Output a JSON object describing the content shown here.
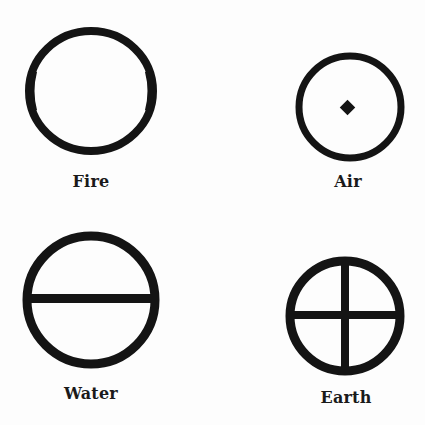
{
  "diagram": {
    "kind": "alchemical-element-symbols",
    "ink_color": "#141414",
    "background_color": "#fdfdfd",
    "elements": [
      {
        "name": "Fire",
        "label": "Fire",
        "symbol": "plain circle",
        "center": [
          91,
          91
        ],
        "radius": [
          64,
          62
        ]
      },
      {
        "name": "Air",
        "label": "Air",
        "symbol": "circle with central diamond dot",
        "center": [
          350,
          107
        ],
        "radius": [
          53,
          53
        ]
      },
      {
        "name": "Water",
        "label": "Water",
        "symbol": "circle with horizontal bar",
        "center": [
          91,
          300
        ],
        "radius": [
          67,
          67
        ]
      },
      {
        "name": "Earth",
        "label": "Earth",
        "symbol": "circle with cross",
        "center": [
          345,
          316
        ],
        "radius": [
          58,
          58
        ]
      }
    ]
  }
}
